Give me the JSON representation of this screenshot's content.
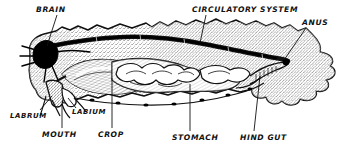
{
  "figure": {
    "style": "pen-and-ink stipple line drawing",
    "width": 340,
    "height": 151,
    "ink_color": "#111111",
    "paper_color": "#ffffff"
  },
  "labels": [
    {
      "id": "brain",
      "text": "BRAIN",
      "x": 36,
      "y": 12,
      "anchor": "start",
      "size": 7.6,
      "leader": {
        "x1": 57,
        "y1": 15,
        "x2": 47,
        "y2": 46
      }
    },
    {
      "id": "circulatory_system",
      "text": "CIRCULATORY SYSTEM",
      "x": 192,
      "y": 12,
      "anchor": "start",
      "size": 7.6,
      "leader": {
        "x1": 206,
        "y1": 15,
        "x2": 200,
        "y2": 43
      }
    },
    {
      "id": "anus",
      "text": "ANUS",
      "x": 302,
      "y": 25,
      "anchor": "start",
      "size": 7.6,
      "leader": {
        "x1": 306,
        "y1": 28,
        "x2": 284,
        "y2": 60
      }
    },
    {
      "id": "labrum",
      "text": "LABRUM",
      "x": 10,
      "y": 118,
      "anchor": "start",
      "size": 7.0,
      "leader": {
        "x1": 40,
        "y1": 110,
        "x2": 52,
        "y2": 96
      }
    },
    {
      "id": "labium",
      "text": "LABIUM",
      "x": 72,
      "y": 114,
      "anchor": "start",
      "size": 7.0,
      "leader": {
        "x1": 76,
        "y1": 108,
        "x2": 68,
        "y2": 98
      }
    },
    {
      "id": "mouth",
      "text": "MOUTH",
      "x": 42,
      "y": 137,
      "anchor": "start",
      "size": 7.6,
      "leader": {
        "x1": 62,
        "y1": 128,
        "x2": 62,
        "y2": 104
      }
    },
    {
      "id": "crop",
      "text": "CROP",
      "x": 98,
      "y": 137,
      "anchor": "start",
      "size": 7.6,
      "leader": {
        "x1": 112,
        "y1": 128,
        "x2": 112,
        "y2": 78
      }
    },
    {
      "id": "stomach",
      "text": "STOMACH",
      "x": 172,
      "y": 140,
      "anchor": "start",
      "size": 7.6,
      "leader": {
        "x1": 190,
        "y1": 131,
        "x2": 190,
        "y2": 84
      }
    },
    {
      "id": "hind_gut",
      "text": "HIND GUT",
      "x": 240,
      "y": 140,
      "anchor": "start",
      "size": 7.6,
      "leader": {
        "x1": 254,
        "y1": 131,
        "x2": 260,
        "y2": 76
      }
    }
  ],
  "structures": [
    {
      "id": "body-outline",
      "name": "insect body outline",
      "note": "irregular jagged segmented lateral silhouette"
    },
    {
      "id": "body-stipple",
      "name": "stippled body fill",
      "note": "fine dot texture across body cavity"
    },
    {
      "id": "dorsal-vessel",
      "name": "circulatory system dorsal vessel",
      "note": "thick dark wavy tube along the dorsal margin"
    },
    {
      "id": "brain-ganglion",
      "name": "brain",
      "note": "solid black lobed mass at anterior end with radiating nerves"
    },
    {
      "id": "crop-organ",
      "name": "crop",
      "note": "large hatched sac behind the head"
    },
    {
      "id": "stomach-organ",
      "name": "stomach",
      "note": "central organ with finger-like gastric caeca"
    },
    {
      "id": "gastric-caeca",
      "name": "gastric caeca",
      "note": "lobed finger projections around the stomach"
    },
    {
      "id": "hind-gut-tube",
      "name": "hind gut",
      "note": "narrow tube running posteriorly to the anus"
    },
    {
      "id": "anus-opening",
      "name": "anus",
      "note": "small black opening at posterior body margin"
    },
    {
      "id": "ventral-nerve-cord",
      "name": "ventral nerve cord",
      "note": "beaded line with ganglia along the ventral margin"
    },
    {
      "id": "mouthparts",
      "name": "mouthparts",
      "note": "labrum and labium at anterior ventral head"
    }
  ]
}
